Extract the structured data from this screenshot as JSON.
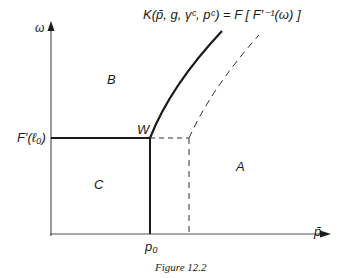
{
  "diagram": {
    "axes": {
      "y_label": "ω",
      "x_label": "p̄",
      "y_tick_label": "F′(ℓ₀)",
      "x_tick_label": "p₀"
    },
    "curve_label": "K(p̄, g, γᶜ, pᶜ) = F [ F′⁻¹(ω) ]",
    "point_label": "W",
    "regions": {
      "A": "A",
      "B": "B",
      "C": "C"
    },
    "caption": "Figure 12.2",
    "colors": {
      "line": "#1a1a1a",
      "background": "#ffffff"
    }
  }
}
